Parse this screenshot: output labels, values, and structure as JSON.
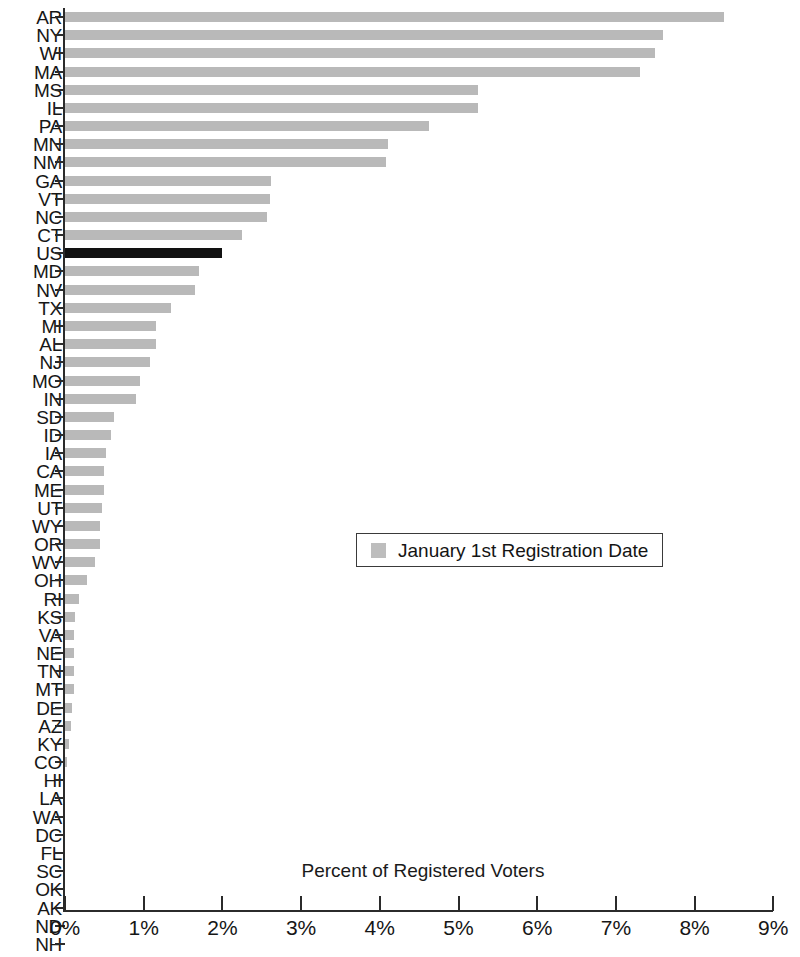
{
  "chart_data": {
    "type": "bar",
    "orientation": "horizontal",
    "title": "",
    "xlabel": "Percent of Registered Voters",
    "ylabel": "",
    "xlim": [
      0,
      9
    ],
    "xtick_labels": [
      "0%",
      "1%",
      "2%",
      "3%",
      "4%",
      "5%",
      "6%",
      "7%",
      "8%",
      "9%"
    ],
    "xtick_values": [
      0,
      1,
      2,
      3,
      4,
      5,
      6,
      7,
      8,
      9
    ],
    "grid": false,
    "legend": {
      "position": "center",
      "entries": [
        {
          "label": "January 1st Registration Date",
          "color": "#bdbdbd"
        }
      ]
    },
    "highlight": {
      "category": "US",
      "color": "#121212"
    },
    "bar_color": "#b9b9b9",
    "categories": [
      "AR",
      "NY",
      "WI",
      "MA",
      "MS",
      "IL",
      "PA",
      "MN",
      "NM",
      "GA",
      "VT",
      "NC",
      "CT",
      "US",
      "MD",
      "NV",
      "TX",
      "MI",
      "AL",
      "NJ",
      "MO",
      "IN",
      "SD",
      "ID",
      "IA",
      "CA",
      "ME",
      "UT",
      "WY",
      "OR",
      "WV",
      "OH",
      "RI",
      "KS",
      "VA",
      "NE",
      "TN",
      "MT",
      "DE",
      "AZ",
      "KY",
      "CO",
      "HI",
      "LA",
      "WA",
      "DC",
      "FL",
      "SC",
      "OK",
      "AK",
      "ND",
      "NH"
    ],
    "values": [
      8.37,
      7.6,
      7.5,
      7.3,
      5.25,
      5.25,
      4.62,
      4.1,
      4.08,
      2.62,
      2.6,
      2.57,
      2.25,
      2.0,
      1.7,
      1.65,
      1.35,
      1.16,
      1.15,
      1.08,
      0.95,
      0.9,
      0.62,
      0.58,
      0.52,
      0.5,
      0.5,
      0.47,
      0.45,
      0.45,
      0.38,
      0.28,
      0.18,
      0.13,
      0.12,
      0.12,
      0.12,
      0.11,
      0.09,
      0.07,
      0.05,
      0.03,
      0.0,
      0.0,
      0.0,
      0.0,
      0.0,
      0.0,
      0.0,
      0.0,
      0.0,
      0.0
    ]
  }
}
